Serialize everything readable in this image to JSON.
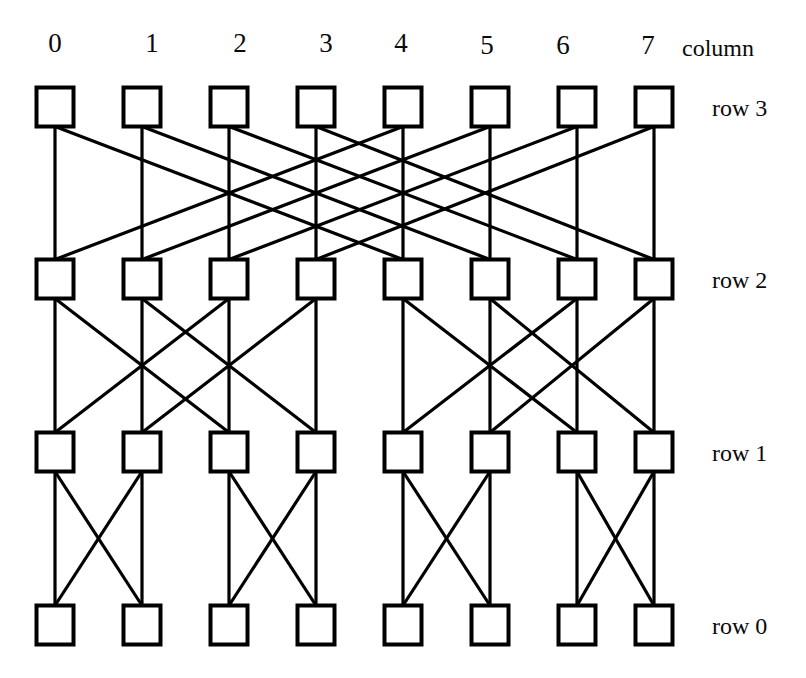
{
  "figure": {
    "width": 806,
    "height": 678,
    "background_color": "#ffffff",
    "line_color": "#000000",
    "node_fill": "#ffffff",
    "node_stroke": "#000000"
  },
  "axis": {
    "column_caption": "column",
    "column_labels": [
      "0",
      "1",
      "2",
      "3",
      "4",
      "5",
      "6",
      "7"
    ],
    "row_labels": [
      "row 3",
      "row 2",
      "row 1",
      "row 0"
    ]
  },
  "chart_data": {
    "type": "diagram",
    "diagram_kind": "butterfly-network",
    "title": "",
    "xlabel": "column",
    "ylabel": "row",
    "columns": [
      0,
      1,
      2,
      3,
      4,
      5,
      6,
      7
    ],
    "rows": [
      3,
      2,
      1,
      0
    ],
    "node_count": 32,
    "nodes": [
      {
        "row": 3,
        "col": 0,
        "x": 55,
        "y": 107
      },
      {
        "row": 3,
        "col": 1,
        "x": 142,
        "y": 107
      },
      {
        "row": 3,
        "col": 2,
        "x": 229,
        "y": 107
      },
      {
        "row": 3,
        "col": 3,
        "x": 316,
        "y": 107
      },
      {
        "row": 3,
        "col": 4,
        "x": 403,
        "y": 107
      },
      {
        "row": 3,
        "col": 5,
        "x": 490,
        "y": 107
      },
      {
        "row": 3,
        "col": 6,
        "x": 577,
        "y": 107
      },
      {
        "row": 3,
        "col": 7,
        "x": 654,
        "y": 107
      },
      {
        "row": 2,
        "col": 0,
        "x": 55,
        "y": 279
      },
      {
        "row": 2,
        "col": 1,
        "x": 142,
        "y": 279
      },
      {
        "row": 2,
        "col": 2,
        "x": 229,
        "y": 279
      },
      {
        "row": 2,
        "col": 3,
        "x": 316,
        "y": 279
      },
      {
        "row": 2,
        "col": 4,
        "x": 403,
        "y": 279
      },
      {
        "row": 2,
        "col": 5,
        "x": 490,
        "y": 279
      },
      {
        "row": 2,
        "col": 6,
        "x": 577,
        "y": 279
      },
      {
        "row": 2,
        "col": 7,
        "x": 654,
        "y": 279
      },
      {
        "row": 1,
        "col": 0,
        "x": 55,
        "y": 452
      },
      {
        "row": 1,
        "col": 1,
        "x": 142,
        "y": 452
      },
      {
        "row": 1,
        "col": 2,
        "x": 229,
        "y": 452
      },
      {
        "row": 1,
        "col": 3,
        "x": 316,
        "y": 452
      },
      {
        "row": 1,
        "col": 4,
        "x": 403,
        "y": 452
      },
      {
        "row": 1,
        "col": 5,
        "x": 490,
        "y": 452
      },
      {
        "row": 1,
        "col": 6,
        "x": 577,
        "y": 452
      },
      {
        "row": 1,
        "col": 7,
        "x": 654,
        "y": 452
      },
      {
        "row": 0,
        "col": 0,
        "x": 55,
        "y": 625
      },
      {
        "row": 0,
        "col": 1,
        "x": 142,
        "y": 625
      },
      {
        "row": 0,
        "col": 2,
        "x": 229,
        "y": 625
      },
      {
        "row": 0,
        "col": 3,
        "x": 316,
        "y": 625
      },
      {
        "row": 0,
        "col": 4,
        "x": 403,
        "y": 625
      },
      {
        "row": 0,
        "col": 5,
        "x": 490,
        "y": 625
      },
      {
        "row": 0,
        "col": 6,
        "x": 577,
        "y": 625
      },
      {
        "row": 0,
        "col": 7,
        "x": 654,
        "y": 625
      }
    ],
    "stages": [
      {
        "from_row": 3,
        "to_row": 2,
        "stride": 4,
        "straight_edges": [
          [
            0,
            0
          ],
          [
            1,
            1
          ],
          [
            2,
            2
          ],
          [
            3,
            3
          ],
          [
            4,
            4
          ],
          [
            5,
            5
          ],
          [
            6,
            6
          ],
          [
            7,
            7
          ]
        ],
        "cross_edges": [
          [
            0,
            4
          ],
          [
            4,
            0
          ],
          [
            1,
            5
          ],
          [
            5,
            1
          ],
          [
            2,
            6
          ],
          [
            6,
            2
          ],
          [
            3,
            7
          ],
          [
            7,
            3
          ]
        ]
      },
      {
        "from_row": 2,
        "to_row": 1,
        "stride": 2,
        "straight_edges": [
          [
            0,
            0
          ],
          [
            1,
            1
          ],
          [
            2,
            2
          ],
          [
            3,
            3
          ],
          [
            4,
            4
          ],
          [
            5,
            5
          ],
          [
            6,
            6
          ],
          [
            7,
            7
          ]
        ],
        "cross_edges": [
          [
            0,
            2
          ],
          [
            2,
            0
          ],
          [
            1,
            3
          ],
          [
            3,
            1
          ],
          [
            4,
            6
          ],
          [
            6,
            4
          ],
          [
            5,
            7
          ],
          [
            7,
            5
          ]
        ]
      },
      {
        "from_row": 1,
        "to_row": 0,
        "stride": 1,
        "straight_edges": [
          [
            0,
            0
          ],
          [
            1,
            1
          ],
          [
            2,
            2
          ],
          [
            3,
            3
          ],
          [
            4,
            4
          ],
          [
            5,
            5
          ],
          [
            6,
            6
          ],
          [
            7,
            7
          ]
        ],
        "cross_edges": [
          [
            0,
            1
          ],
          [
            1,
            0
          ],
          [
            2,
            3
          ],
          [
            3,
            2
          ],
          [
            4,
            5
          ],
          [
            5,
            4
          ],
          [
            6,
            7
          ],
          [
            7,
            6
          ]
        ]
      }
    ],
    "node_box": {
      "width": 37,
      "height": 39,
      "stroke_width": 4
    },
    "edge_stroke_width": 3.2,
    "grid": false,
    "legend": "none"
  },
  "labels": {
    "col_positions_x": [
      55,
      152,
      240,
      326,
      401,
      487,
      563,
      648
    ],
    "col_label_y": 30,
    "caption_x": 682,
    "caption_y": 34,
    "row_positions": [
      {
        "text": "row 3",
        "x": 710,
        "y": 96
      },
      {
        "text": "row 2",
        "x": 710,
        "y": 268
      },
      {
        "text": "row 1",
        "x": 710,
        "y": 442
      },
      {
        "text": "row 0",
        "x": 710,
        "y": 614
      }
    ]
  }
}
